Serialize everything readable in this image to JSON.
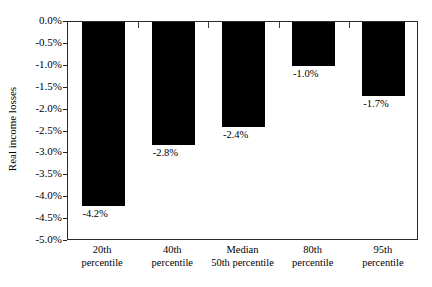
{
  "figure": {
    "clipped_caption_remnant": "",
    "background_color": "#ffffff",
    "bar_color": "#000000",
    "axis_color": "#2a2a2a"
  },
  "chart_data": {
    "type": "bar",
    "title": "",
    "xlabel": "",
    "ylabel": "Real income losses",
    "categories": [
      "20th percentile",
      "40th percentile",
      "Median 50th percentile",
      "80th percentile",
      "95th percentile"
    ],
    "category_lines": [
      [
        "20th",
        "percentile"
      ],
      [
        "40th",
        "percentile"
      ],
      [
        "Median",
        "50th percentile"
      ],
      [
        "80th",
        "percentile"
      ],
      [
        "95th",
        "percentile"
      ]
    ],
    "values": [
      -4.2,
      -2.8,
      -2.4,
      -1.0,
      -1.7
    ],
    "data_labels": [
      "-4.2%",
      "-2.8%",
      "-2.4%",
      "-1.0%",
      "-1.7%"
    ],
    "ylim": [
      -5.0,
      0.0
    ],
    "ytick_values": [
      0.0,
      -0.5,
      -1.0,
      -1.5,
      -2.0,
      -2.5,
      -3.0,
      -3.5,
      -4.0,
      -4.5,
      -5.0
    ],
    "ytick_labels": [
      "0.0%",
      "-0.5%",
      "-1.0%",
      "-1.5%",
      "-2.0%",
      "-2.5%",
      "-3.0%",
      "-3.5%",
      "-4.0%",
      "-4.5%",
      "-5.0%"
    ],
    "grid": false,
    "legend": null,
    "orientation": "vertical-downward"
  }
}
